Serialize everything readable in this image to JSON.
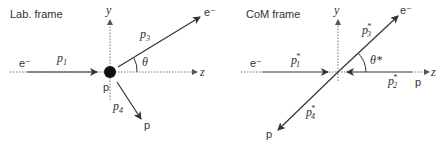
{
  "panels": [
    {
      "title": "Lab. frame",
      "axes": {
        "y": "y",
        "z": "z"
      },
      "incoming": {
        "particle": "e⁻",
        "momentum": "p",
        "sub": "1"
      },
      "target": {
        "particle": "p"
      },
      "scattered_electron": {
        "particle": "e⁻",
        "momentum": "p",
        "sub": "3"
      },
      "recoil_proton": {
        "particle": "p",
        "momentum": "p",
        "sub": "4"
      },
      "angle": "θ"
    },
    {
      "title": "CoM frame",
      "axes": {
        "y": "y",
        "z": "z"
      },
      "incoming_electron": {
        "particle": "e⁻",
        "momentum": "p",
        "sub": "1",
        "sup": "*"
      },
      "incoming_proton": {
        "particle": "p",
        "momentum": "p",
        "sub": "2",
        "sup": "*"
      },
      "scattered_electron": {
        "particle": "e⁻",
        "momentum": "p",
        "sub": "3",
        "sup": "*"
      },
      "recoil_proton": {
        "particle": "p",
        "momentum": "p",
        "sub": "4",
        "sup": "*"
      },
      "angle": "θ*"
    }
  ]
}
